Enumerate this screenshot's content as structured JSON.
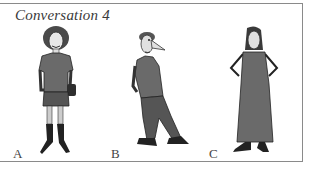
{
  "title": "Conversation 4",
  "figures": [
    {
      "label": "A",
      "description": "woman with curly hair, t-shirt, short skirt, boots, shoulder bag"
    },
    {
      "label": "B",
      "description": "man with large nose, polo shirt, trousers, hands in pockets, leaning"
    },
    {
      "label": "C",
      "description": "woman with long hair, long sleeveless dress, hands on hips"
    }
  ],
  "colors": {
    "border": "#8a8a8a",
    "ink": "#3a3a3a",
    "fill_dark": "#5a5a5a",
    "fill_mid": "#7a7a7a"
  }
}
